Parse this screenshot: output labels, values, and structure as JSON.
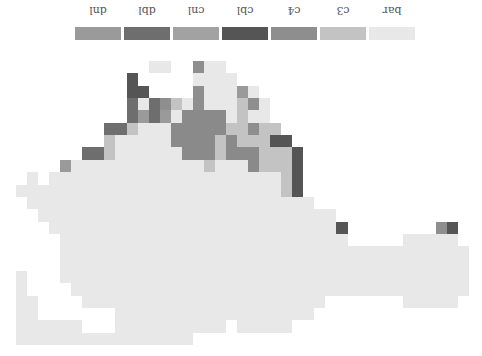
{
  "orientation": "rotated-180",
  "legend": {
    "items": [
      {
        "label": "dnl",
        "color": "#9a9a9a",
        "x": 75
      },
      {
        "label": "dbl",
        "color": "#6e6e6e",
        "x": 124
      },
      {
        "label": "cnl",
        "color": "#a2a2a2",
        "x": 173
      },
      {
        "label": "cbl",
        "color": "#555555",
        "x": 222
      },
      {
        "label": "c4",
        "color": "#8e8e8e",
        "x": 271
      },
      {
        "label": "c3",
        "color": "#c3c3c3",
        "x": 320
      },
      {
        "label": "bar",
        "color": "#e8e8e8",
        "x": 369
      }
    ]
  },
  "map": {
    "origin_x": 16,
    "origin_y": 61,
    "cell_w": 11.05,
    "cell_h": 12.35,
    "codes": {
      "b": {
        "class": "bar",
        "color": "#e8e8e8"
      },
      "3": {
        "class": "c3",
        "color": "#c3c3c3"
      },
      "4": {
        "class": "c4",
        "color": "#8e8e8e"
      },
      "C": {
        "class": "cbl",
        "color": "#555555"
      },
      "N": {
        "class": "cnl",
        "color": "#8a8a8a"
      },
      "D": {
        "class": "dbl",
        "color": "#6e6e6e"
      },
      "n": {
        "class": "dnl",
        "color": "#9a9a9a"
      }
    },
    "rows": [
      "............bb..4bb.......................",
      "..........C.....bbbb......................",
      "..........CC....4bbbnb....................",
      "..........DbD43b4bbb34b...................",
      "..........DnDnbNNNNb3bb...................",
      "........DD3bbbNNNNN33433..................",
      "........3bbbbbNNNN3N333CC.................",
      "......DD3bbbbbbNNN3NNN333C................",
      "....nbbbbbbbbbbbb3bbbN333C................",
      ".b.bbbbbbbbbbbbbbbbbbbbb3C................",
      "bbbbbbbbbbbbbbbbbbbbbbbb3C................",
      ".bbbbbbbbbbbbbbbbbbbbbbbbbb...............",
      "..bbbbbbbbbbbbbbbbbbbbbbbbbbb.............",
      "...bbbbbbbbbbbbbbbbbbbbbbbbbbC........4C..",
      "....bbbbbbbbbbbbbbbbbbbbbbbbbb.....bbbbb..",
      "....bbbbbbbbbbbbbbbbbbbbbbbbbbbbbbbbbbbbb.",
      "....bbbbbbbbbbbbbbbbbbbbbbbbbbbbbbbbbbbbb.",
      "b...bbbbbbbbbbbbbbbbbbbbbbbbbbbbbbbbbbbbb.",
      "b....bbbbbbbbbbbbbbbbbbbbbbbbbbbbbbbbbbbb.",
      "bb....bbbbbbbbbbbbbbbbbbbbbb.......bbbbb..",
      "bb.......bbbbbbbbbbbbbbbbbb...............",
      "bbbbbb...bbbbbbbbbb.bbbbb.................",
      "bbbbbbbbbbbbbbbb..........................",
      ".........................................."
    ]
  }
}
